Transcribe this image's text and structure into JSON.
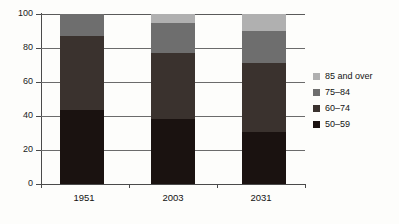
{
  "chart_data": {
    "type": "bar",
    "stacked": true,
    "title": "",
    "subtitle": "",
    "xlabel": "",
    "ylabel": "",
    "categories": [
      "1951",
      "2003",
      "2031"
    ],
    "ylim": [
      0,
      100
    ],
    "yticks": [
      0,
      20,
      40,
      60,
      80,
      100
    ],
    "ytick_labels": [
      "0",
      "20",
      "40",
      "60",
      "80",
      "100"
    ],
    "grid": true,
    "grid_axis": "y",
    "legend_position": "right",
    "series": [
      {
        "name": "50–59",
        "color": "#1a1210",
        "values": [
          43.5,
          38.0,
          30.5
        ]
      },
      {
        "name": "60–74",
        "color": "#3a322e",
        "values": [
          43.5,
          39.0,
          40.5
        ]
      },
      {
        "name": "75–84",
        "color": "#6e6e6e",
        "values": [
          13.0,
          18.0,
          19.0
        ]
      },
      {
        "name": "85 and over",
        "color": "#b0b0b0",
        "values": [
          0.0,
          5.0,
          10.0
        ]
      }
    ],
    "legend_entries": [
      {
        "label": "85 and over",
        "color": "#b0b0b0"
      },
      {
        "label": "75–84",
        "color": "#6e6e6e"
      },
      {
        "label": "60–74",
        "color": "#3a322e"
      },
      {
        "label": "50–59",
        "color": "#1a1210"
      }
    ]
  },
  "axis": {
    "y": {
      "t100": "100",
      "t80": "80",
      "t60": "60",
      "t40": "40",
      "t20": "20",
      "t0": "0"
    },
    "x": {
      "c0": "1951",
      "c1": "2003",
      "c2": "2031"
    }
  },
  "legend": {
    "e0": "85 and over",
    "e1": "75–84",
    "e2": "60–74",
    "e3": "50–59"
  }
}
